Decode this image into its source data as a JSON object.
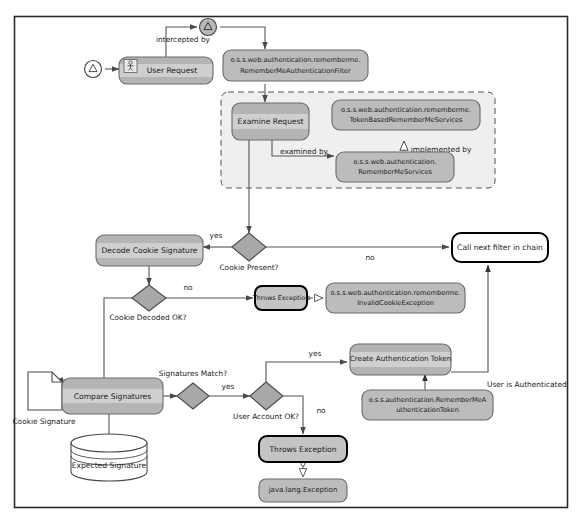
{
  "diagram": {
    "colors": {
      "frame_border": "#2b2b2b",
      "activity_fill": "#b0b0b0",
      "activity_band": "#c9c9c9",
      "activity_stroke": "#6a6a6a",
      "class_fill": "#b8b8b8",
      "class_stroke": "#6a6a6a",
      "decision_fill": "#a8a8a8",
      "decision_stroke": "#4a4a4a",
      "exception_stroke": "#000000",
      "exception_fill": "#c4c4c4",
      "line": "#555555",
      "text": "#1b1b1b",
      "container_fill": "#efefef",
      "container_stroke": "#555555",
      "white": "#ffffff"
    },
    "nodes": {
      "start_node": {
        "label": "",
        "icon": "triangle-warning-circle-icon"
      },
      "user_request": {
        "label": "User Request",
        "icon": "actor-icon"
      },
      "interceptor_node": {
        "label": "",
        "icon": "triangle-warning-circle-icon"
      },
      "remember_me_filter": {
        "line1": "o.s.s.web.authentication.rememberme.",
        "line2": "RememberMeAuthenticationFilter"
      },
      "examine_request": {
        "label": "Examine Request"
      },
      "token_based_services": {
        "line1": "o.s.s.web.authentication.rememberme.",
        "line2": "TokenBasedRememberMeServices"
      },
      "remember_me_services": {
        "line1": "o.s.s.web.authentication.",
        "line2": "RememberMeServices"
      },
      "decode_cookie_signature": {
        "label": "Decode Cookie Signature"
      },
      "cookie_present": {
        "label": "Cookie Present?"
      },
      "cookie_decoded_ok": {
        "label": "Cookie Decoded OK?"
      },
      "throws_exception_cookie": {
        "label": "Throws Exception"
      },
      "invalid_cookie_exception": {
        "line1": "o.s.s.web.authentication.rememberme.",
        "line2": "InvalidCookieException"
      },
      "call_next_filter": {
        "label": "Call next filter in chain"
      },
      "cookie_signature_doc": {
        "label": "Cookie Signature"
      },
      "compare_signatures": {
        "label": "Compare Signatures"
      },
      "expected_signature_db": {
        "label": "Expected Signature"
      },
      "signatures_match": {
        "label": "Signatures Match?"
      },
      "user_account_ok": {
        "label": "User Account OK?"
      },
      "create_auth_token": {
        "label": "Create Authentication Token"
      },
      "remember_me_auth_token": {
        "line1": "o.s.s.authentication.RememberMeA",
        "line2": "uthenticationToken"
      },
      "throws_exception_account": {
        "label": "Throws Exception"
      },
      "java_lang_exception": {
        "label": "java.lang.Exception"
      }
    },
    "edges": {
      "intercepted_by": "intercepted by",
      "examined_by": "examined by",
      "implemented_by": "implemented by",
      "cookie_present_yes": "yes",
      "cookie_present_no": "no",
      "cookie_decoded_no": "no",
      "signatures_match_yes": "yes",
      "user_account_yes": "yes",
      "user_account_no": "no",
      "user_is_authenticated": "User is Authenticated"
    }
  }
}
